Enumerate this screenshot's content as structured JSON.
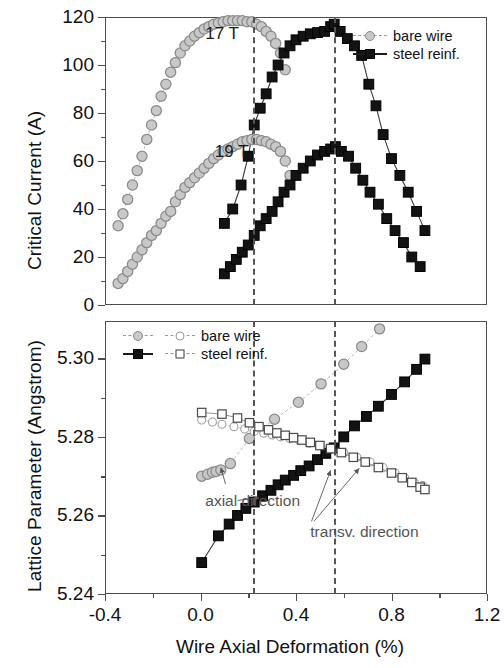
{
  "figure": {
    "xlabel": "Wire Axial Deformation (%)"
  },
  "top_panel": {
    "ylabel": "Critical Current (A)",
    "yticks": [
      "0",
      "20",
      "40",
      "60",
      "80",
      "100",
      "120"
    ],
    "field_labels": [
      {
        "text": "17 T",
        "x": 0.02,
        "y": 112
      },
      {
        "text": "19 T",
        "x": 0.06,
        "y": 63
      }
    ],
    "legend": {
      "entries": [
        {
          "label": "bare wire",
          "marker": "circle-gray",
          "line": "gray-solid"
        },
        {
          "label": "steel reinf.",
          "marker": "square-dark",
          "line": "dark-solid"
        }
      ]
    }
  },
  "bottom_panel": {
    "ylabel": "Lattice Parameter (Angstrom)",
    "yticks": [
      "5.24",
      "5.26",
      "5.28",
      "5.30"
    ],
    "annotations": [
      {
        "text": "axial direction",
        "x": 0.02,
        "y": 5.2635
      },
      {
        "text": "transv. direction",
        "x": 0.46,
        "y": 5.2555
      }
    ],
    "legend": {
      "entries": [
        {
          "label": "bare wire",
          "marker_axial": "circle-gray",
          "marker_transv": "circle-open"
        },
        {
          "label": "steel reinf.",
          "marker_axial": "square-dark",
          "marker_transv": "square-open"
        }
      ]
    }
  },
  "guides": {
    "label": "peak-position-guides",
    "x_values": [
      0.22,
      0.56
    ]
  },
  "chart_data": {
    "type": "line",
    "xlabel": "Wire Axial Deformation (%)",
    "xlim": [
      -0.4,
      1.2
    ],
    "xticks": [
      -0.4,
      0.0,
      0.4,
      0.8,
      1.2
    ],
    "grid": false,
    "vertical_guides": [
      0.22,
      0.56
    ],
    "panels": [
      {
        "name": "critical-current",
        "ylabel": "Critical Current (A)",
        "ylim": [
          0,
          120
        ],
        "yticks": [
          0,
          20,
          40,
          60,
          80,
          100,
          120
        ],
        "legend_position": "top-right",
        "annotations": [
          "17 T",
          "19 T"
        ],
        "series": [
          {
            "name": "bare wire 17 T",
            "marker": "circle-gray",
            "x": [
              -0.345,
              -0.325,
              -0.305,
              -0.285,
              -0.265,
              -0.245,
              -0.225,
              -0.205,
              -0.185,
              -0.165,
              -0.145,
              -0.125,
              -0.105,
              -0.085,
              -0.065,
              -0.045,
              -0.025,
              -0.005,
              0.015,
              0.035,
              0.055,
              0.075,
              0.095,
              0.115,
              0.135,
              0.155,
              0.175,
              0.195,
              0.215,
              0.235,
              0.255,
              0.275,
              0.295,
              0.315,
              0.335,
              0.355
            ],
            "y": [
              33,
              38,
              44,
              50,
              56,
              62,
              69,
              75,
              81,
              87,
              92,
              97,
              101,
              105,
              108,
              110,
              112,
              113.5,
              115,
              116,
              117,
              117.5,
              118,
              118.5,
              118.5,
              118.5,
              118.5,
              118,
              118,
              117,
              116,
              114,
              112,
              109,
              105,
              98
            ]
          },
          {
            "name": "steel reinf. 17 T",
            "marker": "square-dark",
            "x": [
              0.1,
              0.135,
              0.17,
              0.2,
              0.225,
              0.25,
              0.275,
              0.3,
              0.325,
              0.35,
              0.375,
              0.4,
              0.43,
              0.46,
              0.49,
              0.52,
              0.545,
              0.56,
              0.585,
              0.615,
              0.645,
              0.675,
              0.705,
              0.735,
              0.765,
              0.8,
              0.835,
              0.87,
              0.905,
              0.94
            ],
            "y": [
              34,
              40,
              50,
              62,
              75,
              82,
              88,
              95,
              100,
              105,
              108,
              110.5,
              112,
              113,
              113.5,
              114,
              116,
              117,
              114,
              111,
              108,
              104,
              92,
              83,
              71,
              61,
              54,
              47,
              39,
              31
            ]
          },
          {
            "name": "bare wire 19 T",
            "marker": "circle-gray",
            "x": [
              -0.345,
              -0.325,
              -0.305,
              -0.285,
              -0.265,
              -0.245,
              -0.225,
              -0.205,
              -0.185,
              -0.165,
              -0.145,
              -0.125,
              -0.105,
              -0.085,
              -0.065,
              -0.045,
              -0.025,
              -0.005,
              0.015,
              0.035,
              0.055,
              0.075,
              0.095,
              0.115,
              0.135,
              0.155,
              0.175,
              0.195,
              0.215,
              0.235,
              0.255,
              0.275,
              0.295,
              0.315,
              0.335,
              0.355,
              0.375
            ],
            "y": [
              9,
              11,
              14,
              17,
              20,
              23,
              26,
              29,
              31,
              34,
              37,
              39,
              43,
              46,
              49,
              51,
              53,
              55,
              57,
              59,
              61,
              62.5,
              64,
              65,
              66,
              67,
              68,
              68.5,
              69,
              69,
              68.5,
              68,
              67,
              66,
              64,
              60,
              54
            ]
          },
          {
            "name": "steel reinf. 19 T",
            "marker": "square-dark",
            "x": [
              0.1,
              0.125,
              0.15,
              0.175,
              0.2,
              0.225,
              0.25,
              0.275,
              0.3,
              0.325,
              0.35,
              0.375,
              0.4,
              0.43,
              0.46,
              0.49,
              0.52,
              0.545,
              0.565,
              0.59,
              0.62,
              0.65,
              0.68,
              0.71,
              0.745,
              0.78,
              0.815,
              0.85,
              0.885,
              0.92
            ],
            "y": [
              13,
              16,
              19,
              22,
              25,
              29,
              33,
              36,
              39,
              43,
              47,
              50,
              54,
              57,
              60,
              62.5,
              64,
              65,
              66,
              64,
              62,
              57,
              52,
              47,
              42,
              36,
              31,
              26,
              20,
              16
            ]
          }
        ]
      },
      {
        "name": "lattice-parameter",
        "ylabel": "Lattice Parameter (Angstrom)",
        "ylim": [
          5.24,
          5.3095
        ],
        "yticks": [
          5.24,
          5.26,
          5.28,
          5.3
        ],
        "legend_position": "top-left",
        "annotations": [
          "axial direction",
          "transv. direction"
        ],
        "series": [
          {
            "name": "bare wire axial",
            "marker": "circle-gray",
            "x": [
              0.005,
              0.03,
              0.05,
              0.065,
              0.085,
              0.125,
              0.205,
              0.31,
              0.41,
              0.505,
              0.6,
              0.675,
              0.75
            ],
            "y": [
              5.27,
              5.2705,
              5.271,
              5.2712,
              5.2716,
              5.2732,
              5.2796,
              5.2845,
              5.2888,
              5.2935,
              5.2985,
              5.303,
              5.3075
            ]
          },
          {
            "name": "bare wire transv.",
            "marker": "circle-open",
            "x": [
              0.005,
              0.05,
              0.09,
              0.14,
              0.185,
              0.225,
              0.265,
              0.3,
              0.335,
              0.375,
              0.415,
              0.455,
              0.5,
              0.55,
              0.6,
              0.655,
              0.71,
              0.765,
              0.815,
              0.855,
              0.895,
              0.93
            ],
            "y": [
              5.2843,
              5.2838,
              5.2832,
              5.2826,
              5.282,
              5.2814,
              5.2809,
              5.2805,
              5.28,
              5.2795,
              5.279,
              5.2784,
              5.2778,
              5.277,
              5.276,
              5.2748,
              5.2736,
              5.2722,
              5.2708,
              5.2696,
              5.2684,
              5.2676
            ]
          },
          {
            "name": "steel reinf. axial",
            "marker": "square-dark",
            "x": [
              0.005,
              0.075,
              0.12,
              0.155,
              0.19,
              0.225,
              0.26,
              0.295,
              0.325,
              0.355,
              0.39,
              0.42,
              0.455,
              0.49,
              0.525,
              0.56,
              0.6,
              0.645,
              0.695,
              0.745,
              0.8,
              0.855,
              0.905,
              0.94
            ],
            "y": [
              5.248,
              5.2548,
              5.2578,
              5.26,
              5.2618,
              5.2634,
              5.265,
              5.2664,
              5.2678,
              5.269,
              5.2702,
              5.2714,
              5.2726,
              5.2742,
              5.2758,
              5.2772,
              5.28,
              5.2828,
              5.2852,
              5.2878,
              5.2908,
              5.294,
              5.2972,
              5.2998
            ]
          },
          {
            "name": "steel reinf. transv.",
            "marker": "square-open",
            "x": [
              0.005,
              0.09,
              0.155,
              0.205,
              0.245,
              0.285,
              0.32,
              0.355,
              0.39,
              0.425,
              0.46,
              0.5,
              0.545,
              0.59,
              0.64,
              0.69,
              0.745,
              0.8,
              0.845,
              0.885,
              0.92,
              0.94
            ],
            "y": [
              5.2862,
              5.2858,
              5.2848,
              5.2836,
              5.2826,
              5.2818,
              5.281,
              5.2804,
              5.2798,
              5.2792,
              5.2786,
              5.2778,
              5.277,
              5.276,
              5.2748,
              5.2736,
              5.2722,
              5.2708,
              5.2696,
              5.2684,
              5.2672,
              5.2666
            ]
          }
        ]
      }
    ]
  }
}
